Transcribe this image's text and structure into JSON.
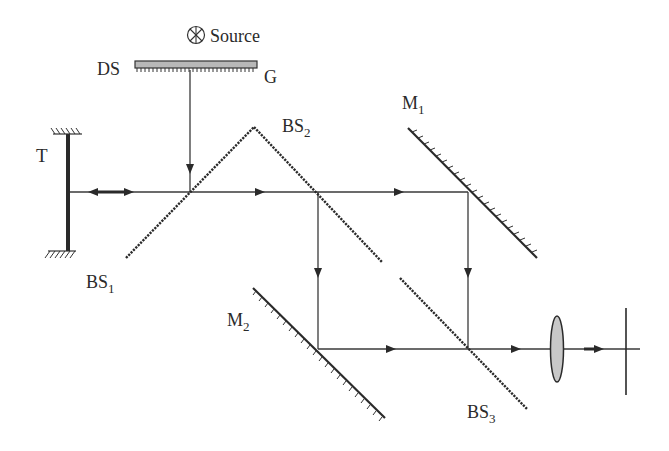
{
  "diagram": {
    "type": "optical-setup",
    "colors": {
      "line": "#3a3a3a",
      "splitter": "#2a2a2a",
      "grating_fill": "#b8b8b8",
      "lens_fill": "#c8c8c8",
      "text": "#2a2a2a"
    },
    "labels": {
      "source": "Source",
      "grating_ds": "DS",
      "grating_g": "G",
      "target": "T",
      "bs1": "BS",
      "bs1_sub": "1",
      "bs2": "BS",
      "bs2_sub": "2",
      "bs3": "BS",
      "bs3_sub": "3",
      "m1": "M",
      "m1_sub": "1",
      "m2": "M",
      "m2_sub": "2"
    },
    "components": [
      {
        "id": "source",
        "label": "Source",
        "icon": "circled-x-icon"
      },
      {
        "id": "grating",
        "labels": [
          "DS",
          "G"
        ]
      },
      {
        "id": "target-mirror",
        "label": "T"
      },
      {
        "id": "beam-splitter-1",
        "label": "BS1"
      },
      {
        "id": "beam-splitter-2",
        "label": "BS2"
      },
      {
        "id": "mirror-1",
        "label": "M1"
      },
      {
        "id": "mirror-2",
        "label": "M2"
      },
      {
        "id": "beam-splitter-3",
        "label": "BS3"
      },
      {
        "id": "lens",
        "label": ""
      },
      {
        "id": "detector",
        "label": ""
      }
    ]
  }
}
